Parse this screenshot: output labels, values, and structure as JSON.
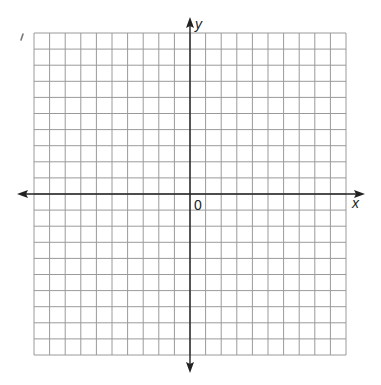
{
  "diagram": {
    "type": "coordinate-plane",
    "grid": {
      "columns": 20,
      "rows": 20,
      "x_min": -10,
      "x_max": 10,
      "y_min": -10,
      "y_max": 10,
      "line_color": "#9a9a9a",
      "axis_color": "#222222"
    },
    "labels": {
      "x_axis": "x",
      "y_axis": "y",
      "origin": "0"
    },
    "stray_mark": true
  }
}
